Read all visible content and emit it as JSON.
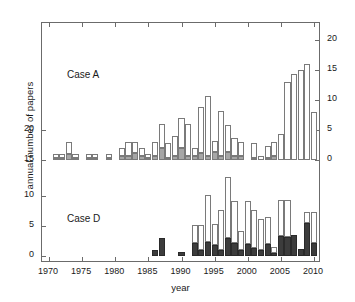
{
  "figure": {
    "xlabel": "year",
    "ylabel": "annual number of papers",
    "panel_a_label": "Case A",
    "panel_d_label": "Case D"
  },
  "axes": {
    "x_ticks": [
      "1970",
      "1975",
      "1980",
      "1985",
      "1990",
      "1995",
      "2000",
      "2005",
      "2010"
    ],
    "y_left_ticks": [
      "0",
      "5",
      "10",
      "15",
      "20"
    ],
    "y_right_ticks": [
      "0",
      "5",
      "10",
      "15",
      "20"
    ]
  },
  "colors": {
    "open": "#ffffff",
    "grey": "#a6a6a6",
    "dark": "#3c3c3c",
    "frame": "#6b6b6b",
    "text": "#1a1a1a"
  },
  "chart_data": {
    "type": "bar",
    "title": "",
    "xlabel": "year",
    "ylabel": "annual number of papers",
    "grid": false,
    "legend": "none",
    "subplot_layout": "two stacked panels sharing one frame",
    "panels": [
      {
        "name": "Case A",
        "axis": "right",
        "ylim": [
          0,
          20
        ],
        "y_ticks": [
          0,
          5,
          10,
          15,
          20
        ],
        "x": [
          1970,
          1971,
          1972,
          1973,
          1974,
          1975,
          1976,
          1977,
          1978,
          1979,
          1980,
          1981,
          1982,
          1983,
          1984,
          1985,
          1986,
          1987,
          1988,
          1989,
          1990,
          1991,
          1992,
          1993,
          1994,
          1995,
          1996,
          1997,
          1998,
          1999,
          2000,
          2001,
          2002,
          2003,
          2004,
          2005,
          2006,
          2007,
          2008,
          2009,
          2010
        ],
        "series": [
          {
            "name": "shaded (grey) portion",
            "values": [
              0,
              0.4,
              0.4,
              1.0,
              0.4,
              0,
              0.4,
              0.4,
              0,
              0.4,
              0,
              0.6,
              0.6,
              1.2,
              0.6,
              0.4,
              0.6,
              2.0,
              0.4,
              0.6,
              2.0,
              0.6,
              0.6,
              1.2,
              0.6,
              1.4,
              0.6,
              1.4,
              0.6,
              0.6,
              0,
              0.4,
              0,
              0.4,
              0.6,
              0,
              0,
              0,
              0,
              0,
              0
            ]
          },
          {
            "name": "open (white) portion",
            "values": [
              0,
              0.6,
              0.6,
              2.0,
              0.6,
              0,
              0.6,
              0.6,
              0,
              0.6,
              0,
              1.4,
              2.4,
              1.8,
              1.4,
              0.6,
              2.4,
              4.0,
              2.4,
              3.4,
              5.0,
              5.4,
              1.4,
              7.6,
              10.0,
              1.8,
              7.6,
              4.4,
              3.0,
              2.4,
              0,
              2.4,
              0.6,
              2.0,
              2.4,
              4.4,
              13.0,
              14.4,
              15.0,
              16.0,
              8.0
            ]
          }
        ],
        "totals": [
          0,
          1,
          1,
          3,
          1,
          0,
          1,
          1,
          0,
          1,
          0,
          2,
          3,
          3,
          2,
          1,
          3,
          6,
          3,
          4,
          7,
          6,
          2,
          9,
          11,
          3,
          8,
          6,
          4,
          3,
          0,
          3,
          1,
          2,
          3,
          4.4,
          13,
          14.4,
          15,
          16,
          8
        ]
      },
      {
        "name": "Case D",
        "axis": "left",
        "ylim": [
          0,
          20
        ],
        "y_ticks": [
          0,
          5,
          10,
          15,
          20
        ],
        "x": [
          1970,
          1971,
          1972,
          1973,
          1974,
          1975,
          1976,
          1977,
          1978,
          1979,
          1980,
          1981,
          1982,
          1983,
          1984,
          1985,
          1986,
          1987,
          1988,
          1989,
          1990,
          1991,
          1992,
          1993,
          1994,
          1995,
          1996,
          1997,
          1998,
          1999,
          2000,
          2001,
          2002,
          2003,
          2004,
          2005,
          2006,
          2007,
          2008,
          2009,
          2010
        ],
        "series": [
          {
            "name": "shaded (dark) portion",
            "values": [
              0,
              0,
              0,
              0,
              0,
              0,
              0,
              0,
              0,
              0,
              0,
              0,
              0,
              0,
              0,
              0,
              1.0,
              3.0,
              0,
              0,
              0.6,
              0,
              2.2,
              1.0,
              2.4,
              1.8,
              1.0,
              3.0,
              2.2,
              1.0,
              2.0,
              1.4,
              1.0,
              2.0,
              0.5,
              3.3,
              3.2,
              3.5,
              1.2,
              5.5,
              2.2
            ]
          },
          {
            "name": "open (white) portion",
            "values": [
              0,
              0,
              0,
              0,
              0,
              0,
              0,
              0,
              0,
              0,
              0,
              0,
              0,
              0,
              0,
              0,
              0,
              0,
              0,
              0,
              0,
              0,
              3.0,
              4.2,
              7.7,
              3.5,
              6.6,
              10.2,
              7.0,
              3.2,
              7.2,
              6.2,
              5.2,
              4.5,
              1.0,
              6.0,
              6.1,
              0,
              0,
              1.8,
              5.1
            ]
          }
        ],
        "totals": [
          0,
          0,
          0,
          0,
          0,
          0,
          0,
          0,
          0,
          0,
          0,
          0,
          0,
          0,
          0,
          0,
          1,
          3,
          0,
          0,
          0.6,
          0,
          5.2,
          5.2,
          10.1,
          5.3,
          7.6,
          13.2,
          9.2,
          4.2,
          9.2,
          7.6,
          6.2,
          6.5,
          1.5,
          9.3,
          9.3,
          3.5,
          1.2,
          7.3,
          7.3
        ]
      }
    ]
  }
}
